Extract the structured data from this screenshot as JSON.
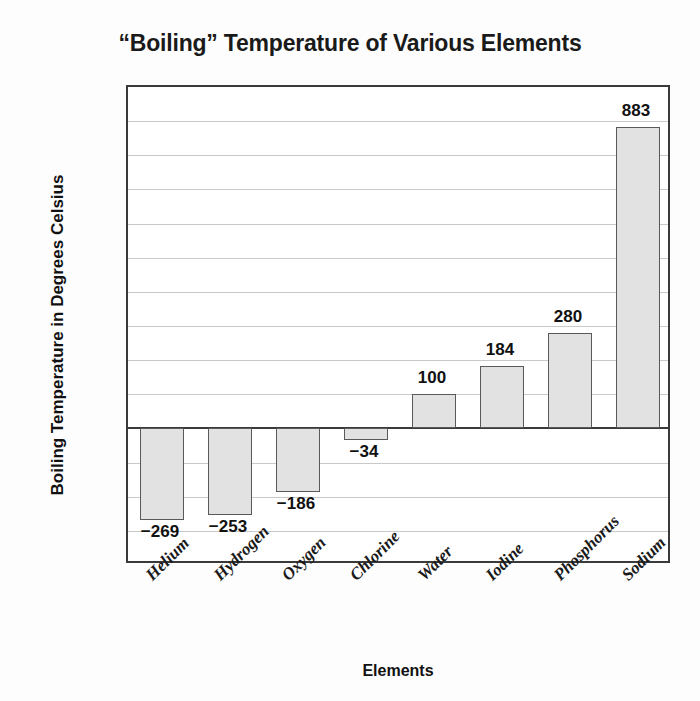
{
  "chart_data": {
    "type": "bar",
    "title": "“Boiling” Temperature of Various Elements",
    "xlabel": "Elements",
    "ylabel": "Boiling Temperature in Degrees Celsius",
    "categories": [
      "Helium",
      "Hydrogen",
      "Oxygen",
      "Chlorine",
      "Water",
      "Iodine",
      "Phosphorus",
      "Sodium"
    ],
    "values": [
      -269,
      -253,
      -186,
      -34,
      100,
      184,
      280,
      883
    ],
    "value_labels": [
      "−269",
      "−253",
      "−186",
      "−34",
      "100",
      "184",
      "280",
      "883"
    ],
    "ylim": [
      -400,
      1000
    ],
    "ytick_values": [
      1000,
      900,
      800,
      700,
      600,
      500,
      400,
      300,
      200,
      100,
      0,
      -100,
      -200,
      -300,
      -400
    ],
    "ytick_labels": [
      "1000",
      "900",
      "800",
      "700",
      "600",
      "500",
      "400",
      "300",
      "200",
      "100",
      "0",
      "−100",
      "−200",
      "−300",
      "−400"
    ],
    "grid": true,
    "legend": null,
    "bar_fill_color": "#e2e2e2",
    "bar_edge_color": "#595959",
    "axis_color": "#3a3a3a",
    "gridline_color": "#c9c9c9"
  }
}
